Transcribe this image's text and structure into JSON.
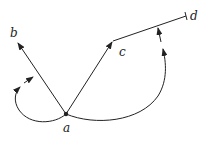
{
  "diagram": {
    "points": {
      "a": {
        "label": "a",
        "x": 66,
        "y": 114
      },
      "b": {
        "label": "b",
        "x": 17,
        "y": 42
      },
      "c": {
        "label": "c",
        "x": 113,
        "y": 41
      },
      "d": {
        "label": "d",
        "x": 186,
        "y": 16
      }
    },
    "edges": [
      {
        "from": "a",
        "to": "b",
        "arrow": true
      },
      {
        "from": "a",
        "to": "c",
        "arrow": true
      },
      {
        "from": "c",
        "to": "d",
        "arrow": false,
        "end_tick": true
      }
    ],
    "arcs": [
      {
        "name": "angle-arc-a-b",
        "arrows": 2
      },
      {
        "name": "angle-arc-a-cd",
        "arrows": 2
      }
    ],
    "colors": {
      "stroke": "#222222",
      "background": "#ffffff"
    }
  }
}
